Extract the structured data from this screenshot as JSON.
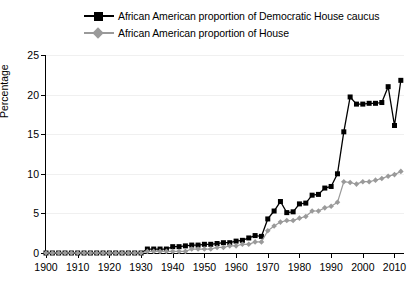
{
  "chart_data": {
    "type": "line",
    "title": "",
    "xlabel": "",
    "ylabel": "Percentage",
    "xlim": [
      1900,
      2013
    ],
    "ylim": [
      0,
      25
    ],
    "xticks": [
      1900,
      1910,
      1920,
      1930,
      1940,
      1950,
      1960,
      1970,
      1980,
      1990,
      2000,
      2010
    ],
    "yticks": [
      0,
      5,
      10,
      15,
      20,
      25
    ],
    "grid": true,
    "legend_position": "top",
    "series": [
      {
        "name": "African American proportion of Democratic House caucus",
        "color": "#000000",
        "marker": "square",
        "x": [
          1900,
          1902,
          1904,
          1906,
          1908,
          1910,
          1912,
          1914,
          1916,
          1918,
          1920,
          1922,
          1924,
          1926,
          1928,
          1930,
          1932,
          1934,
          1936,
          1938,
          1940,
          1942,
          1944,
          1946,
          1948,
          1950,
          1952,
          1954,
          1956,
          1958,
          1960,
          1962,
          1964,
          1966,
          1968,
          1970,
          1972,
          1974,
          1976,
          1978,
          1980,
          1982,
          1984,
          1986,
          1988,
          1990,
          1992,
          1994,
          1996,
          1998,
          2000,
          2002,
          2004,
          2006,
          2008,
          2010,
          2012
        ],
        "y": [
          0,
          0,
          0,
          0,
          0,
          0,
          0,
          0,
          0,
          0,
          0,
          0,
          0,
          0,
          0,
          0,
          0.5,
          0.5,
          0.5,
          0.5,
          0.8,
          0.8,
          0.9,
          1.0,
          1.0,
          1.1,
          1.1,
          1.2,
          1.3,
          1.3,
          1.5,
          1.6,
          1.9,
          2.2,
          2.1,
          4.3,
          5.3,
          6.5,
          5.1,
          5.2,
          6.2,
          6.3,
          7.3,
          7.4,
          8.2,
          8.4,
          10.0,
          15.3,
          19.7,
          18.8,
          18.8,
          18.9,
          18.9,
          19.0,
          21.0,
          16.1,
          21.8
        ]
      },
      {
        "name": "African American proportion of House",
        "color": "#9a9a9a",
        "marker": "diamond",
        "x": [
          1900,
          1902,
          1904,
          1906,
          1908,
          1910,
          1912,
          1914,
          1916,
          1918,
          1920,
          1922,
          1924,
          1926,
          1928,
          1930,
          1932,
          1934,
          1936,
          1938,
          1940,
          1942,
          1944,
          1946,
          1948,
          1950,
          1952,
          1954,
          1956,
          1958,
          1960,
          1962,
          1964,
          1966,
          1968,
          1970,
          1972,
          1974,
          1976,
          1978,
          1980,
          1982,
          1984,
          1986,
          1988,
          1990,
          1992,
          1994,
          1996,
          1998,
          2000,
          2002,
          2004,
          2006,
          2008,
          2010,
          2012
        ],
        "y": [
          0,
          0,
          0,
          0,
          0,
          0,
          0,
          0,
          0,
          0,
          0,
          0,
          0,
          0,
          0,
          0,
          0.2,
          0.2,
          0.2,
          0.2,
          0.2,
          0.2,
          0.2,
          0.5,
          0.5,
          0.5,
          0.5,
          0.7,
          0.7,
          0.9,
          0.9,
          1.1,
          1.1,
          1.4,
          1.4,
          2.8,
          3.4,
          3.9,
          4.1,
          4.1,
          4.4,
          4.6,
          5.3,
          5.3,
          5.7,
          5.9,
          6.4,
          9.0,
          8.9,
          8.7,
          9.0,
          9.0,
          9.2,
          9.4,
          9.7,
          9.9,
          10.3
        ]
      }
    ]
  }
}
